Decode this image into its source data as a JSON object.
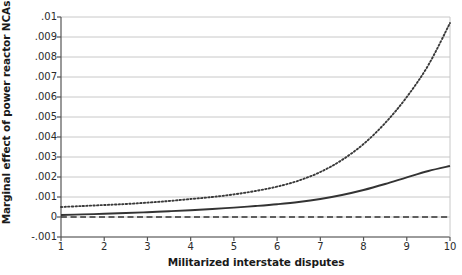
{
  "chart_data": {
    "type": "line",
    "title": "",
    "xlabel": "Militarized interstate disputes",
    "ylabel": "Marginal effect of power reactor NCAs",
    "xlim": [
      1,
      10
    ],
    "ylim": [
      -0.001,
      0.01
    ],
    "xticks": [
      1,
      2,
      3,
      4,
      5,
      6,
      7,
      8,
      9,
      10
    ],
    "xtick_labels": [
      "1",
      "2",
      "3",
      "4",
      "5",
      "6",
      "7",
      "8",
      "9",
      "10"
    ],
    "yticks": [
      0.01,
      0.009,
      0.008,
      0.007,
      0.006,
      0.005,
      0.004,
      0.003,
      0.002,
      0.001,
      0,
      -0.001
    ],
    "ytick_labels": [
      ".01",
      ".009",
      ".008",
      ".007",
      ".006",
      ".005",
      ".004",
      ".003",
      ".002",
      ".001",
      "0",
      "-.001"
    ],
    "grid": "horizontal",
    "legend": "none",
    "x": [
      1,
      1.5,
      2,
      2.5,
      3,
      3.5,
      4,
      4.5,
      5,
      5.5,
      6,
      6.5,
      7,
      7.5,
      8,
      8.5,
      9,
      9.5,
      10
    ],
    "series": [
      {
        "name": "upper-confidence-bound",
        "style": "dotted",
        "color": "#3a3a3a",
        "values": [
          0.0005,
          0.00055,
          0.0006,
          0.00065,
          0.00072,
          0.0008,
          0.0009,
          0.001,
          0.00113,
          0.0013,
          0.00152,
          0.00182,
          0.00225,
          0.00285,
          0.00365,
          0.0047,
          0.006,
          0.0076,
          0.0097
        ]
      },
      {
        "name": "marginal-effect-estimate",
        "style": "solid",
        "color": "#333333",
        "values": [
          0.0001,
          0.00013,
          0.00016,
          0.0002,
          0.00024,
          0.00029,
          0.00034,
          0.0004,
          0.00047,
          0.00055,
          0.00064,
          0.00075,
          0.0009,
          0.0011,
          0.00135,
          0.00165,
          0.00198,
          0.0023,
          0.00255
        ]
      },
      {
        "name": "zero-reference-line",
        "style": "dashed",
        "color": "#333333",
        "values": [
          0,
          0,
          0,
          0,
          0,
          0,
          0,
          0,
          0,
          0,
          0,
          0,
          0,
          0,
          0,
          0,
          0,
          0,
          0
        ]
      }
    ]
  },
  "axes": {
    "ylabel_text": "Marginal effect of power reactor NCAs",
    "xlabel_text": "Militarized interstate disputes"
  },
  "colors": {
    "grid": "#c8c8c8",
    "axis": "#555555",
    "curve": "#333333",
    "background": "#ffffff"
  }
}
